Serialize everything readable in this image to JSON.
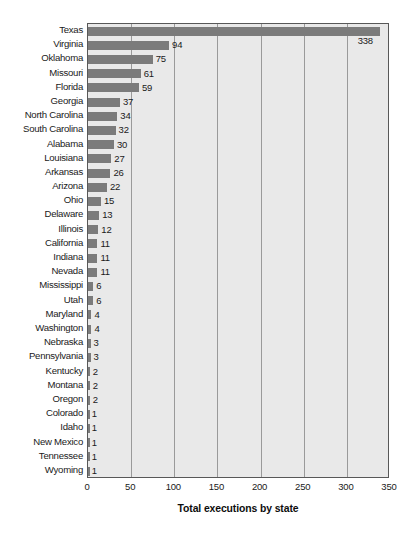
{
  "chart_data": {
    "type": "bar",
    "orientation": "horizontal",
    "title": "",
    "xlabel": "Total executions by state",
    "ylabel": "",
    "xlim": [
      0,
      350
    ],
    "xticks": [
      0,
      50,
      100,
      150,
      200,
      250,
      300,
      350
    ],
    "grid": true,
    "legend": null,
    "categories": [
      "Texas",
      "Virginia",
      "Oklahoma",
      "Missouri",
      "Florida",
      "Georgia",
      "North Carolina",
      "South Carolina",
      "Alabama",
      "Louisiana",
      "Arkansas",
      "Arizona",
      "Ohio",
      "Delaware",
      "Illinois",
      "California",
      "Indiana",
      "Nevada",
      "Mississippi",
      "Utah",
      "Maryland",
      "Washington",
      "Nebraska",
      "Pennsylvania",
      "Kentucky",
      "Montana",
      "Oregon",
      "Colorado",
      "Idaho",
      "New Mexico",
      "Tennessee",
      "Wyoming"
    ],
    "values": [
      338,
      94,
      75,
      61,
      59,
      37,
      34,
      32,
      30,
      27,
      26,
      22,
      15,
      13,
      12,
      11,
      11,
      11,
      6,
      6,
      4,
      4,
      3,
      3,
      2,
      2,
      2,
      1,
      1,
      1,
      1,
      1
    ],
    "data_labels": [
      "338",
      "94",
      "75",
      "61",
      "59",
      "37",
      "34",
      "32",
      "30",
      "27",
      "26",
      "22",
      "15",
      "13",
      "12",
      "11",
      "11",
      "11",
      "6",
      "6",
      "4",
      "4",
      "3",
      "3",
      "2",
      "2",
      "2",
      "1",
      "1",
      "1",
      "1",
      "1"
    ],
    "colors": {
      "bar": "#7b7b7b",
      "plot_background": "#e9e9e9",
      "page_background": "#ffffff",
      "gridline": "#9a9a9a",
      "frame": "#585858",
      "text": "#1a1a1a"
    }
  }
}
